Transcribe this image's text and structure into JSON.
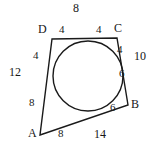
{
  "diagram": {
    "kind": "tangential-quadrilateral-with-inscribed-circle",
    "stroke_color": "#1a1a1a",
    "background_color": "#ffffff",
    "vertices": [
      {
        "id": "A",
        "label": "A",
        "x": 40,
        "y": 135,
        "label_x": 28,
        "label_y": 133
      },
      {
        "id": "B",
        "label": "B",
        "x": 128,
        "y": 105,
        "label_x": 131,
        "label_y": 103
      },
      {
        "id": "C",
        "label": "C",
        "x": 117,
        "y": 38,
        "label_x": 116,
        "label_y": 27
      },
      {
        "id": "D",
        "label": "D",
        "x": 52,
        "y": 39,
        "label_x": 40,
        "label_y": 28
      }
    ],
    "circle": {
      "cx": 88,
      "cy": 76,
      "r": 35
    },
    "tangent_segments": [
      {
        "id": "DP",
        "value": "4",
        "x": 62,
        "y": 29,
        "side": "DC",
        "near_vertex": "D"
      },
      {
        "id": "PC",
        "value": "4",
        "x": 98,
        "y": 29,
        "side": "DC",
        "near_vertex": "C"
      },
      {
        "id": "CQ",
        "value": "4",
        "x": 119,
        "y": 50,
        "side": "CB",
        "near_vertex": "C"
      },
      {
        "id": "QB",
        "value": "6",
        "x": 122,
        "y": 72,
        "side": "CB",
        "near_vertex": "B"
      },
      {
        "id": "BR",
        "value": "6",
        "x": 113,
        "y": 107,
        "side": "BA",
        "near_vertex": "B"
      },
      {
        "id": "RA",
        "value": "8",
        "x": 61,
        "y": 133,
        "side": "BA",
        "near_vertex": "A"
      },
      {
        "id": "AS",
        "value": "8",
        "x": 32,
        "y": 103,
        "side": "AD",
        "near_vertex": "A"
      },
      {
        "id": "SD",
        "value": "4",
        "x": 36,
        "y": 56,
        "side": "AD",
        "near_vertex": "D"
      }
    ],
    "side_totals": [
      {
        "id": "DC",
        "value": "8",
        "x": 76,
        "y": 6
      },
      {
        "id": "CB",
        "value": "10",
        "x": 139,
        "y": 56
      },
      {
        "id": "AB",
        "value": "14",
        "x": 99,
        "y": 134
      },
      {
        "id": "AD",
        "value": "12",
        "x": 13,
        "y": 72
      }
    ]
  }
}
